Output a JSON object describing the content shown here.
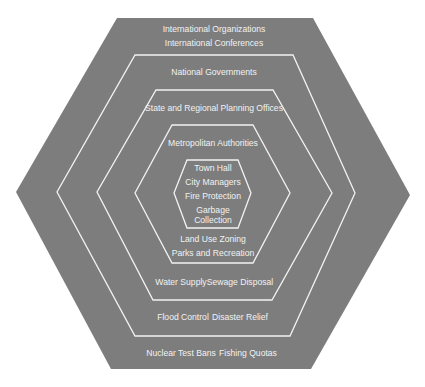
{
  "diagram": {
    "type": "nested-hexagons",
    "colors": {
      "fill": "#7d7d7d",
      "border": "#f2f2f2",
      "text": "#f2f2f2",
      "background": "#ffffff"
    },
    "levels": [
      {
        "name": "global",
        "labels_top": [
          "International Organizations",
          "International Conferences"
        ],
        "labels_bottom": [
          "Nuclear Test Bans",
          "Fishing Quotas"
        ]
      },
      {
        "name": "national",
        "labels_top": [
          "National Governments"
        ],
        "labels_bottom": [
          "Flood Control",
          "Disaster Relief"
        ]
      },
      {
        "name": "regional",
        "labels_top": [
          "State and Regional Planning Offices"
        ],
        "labels_bottom": [
          "Water Supply",
          "Sewage Disposal"
        ]
      },
      {
        "name": "metropolitan",
        "labels_top": [
          "Metropolitan Authorities"
        ],
        "labels_bottom": [
          "Land Use Zoning",
          "Parks and Recreation"
        ]
      },
      {
        "name": "local",
        "labels": [
          "Town Hall",
          "City Managers",
          "Fire Protection",
          "Garbage",
          "Collection"
        ]
      }
    ]
  }
}
